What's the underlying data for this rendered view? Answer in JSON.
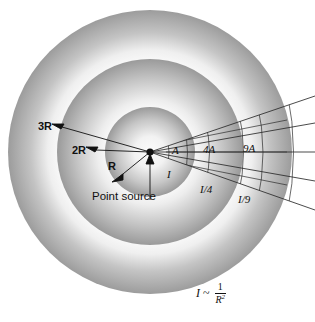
{
  "diagram": {
    "background_color": "#ffffff",
    "ink_color": "#111111",
    "shell_colors": {
      "light": "#f7f7f7",
      "mid": "#c8c8c8",
      "dark": "#9a9a9a"
    },
    "source": {
      "label": "Point source",
      "center_x": 150,
      "center_y": 152
    },
    "radii_labels": [
      {
        "key": "r1",
        "text": "R",
        "radius_px": 45
      },
      {
        "key": "r2",
        "text": "2R",
        "radius_px": 93
      },
      {
        "key": "r3",
        "text": "3R",
        "radius_px": 142
      }
    ],
    "area_labels": [
      {
        "text": "A",
        "shell": "R"
      },
      {
        "text": "4A",
        "shell": "2R"
      },
      {
        "text": "9A",
        "shell": "3R"
      }
    ],
    "intensity_labels": [
      {
        "text": "I",
        "shell": "R"
      },
      {
        "text": "I/4",
        "shell": "2R"
      },
      {
        "text": "I/9",
        "shell": "3R"
      }
    ],
    "formula": {
      "variable": "I",
      "relation": "~",
      "numerator": "1",
      "denominator": "R",
      "exponent": "2",
      "plain": "I ~ 1/R^2"
    },
    "ray_count": 5
  }
}
